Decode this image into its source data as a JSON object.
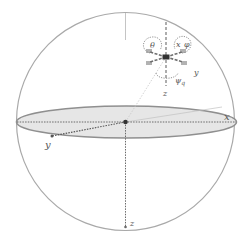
{
  "diagram": {
    "type": "sphere-reference-frame",
    "colors": {
      "sphere_stroke": "#a9a9a9",
      "ellipse_fill": "#e6e6e6",
      "ellipse_stroke": "#8f8f8f",
      "axis": "#6a6a6a",
      "label": "#555555"
    },
    "world_frame": {
      "x_label": "x",
      "y_label": "y",
      "z_label": "z"
    },
    "body_frame": {
      "roll_label": "θ",
      "pitch_label": "φ",
      "x_label": "x",
      "y_label": "y",
      "z_label": "z",
      "yaw_label": "ψ",
      "yaw_subscript": "q"
    }
  }
}
